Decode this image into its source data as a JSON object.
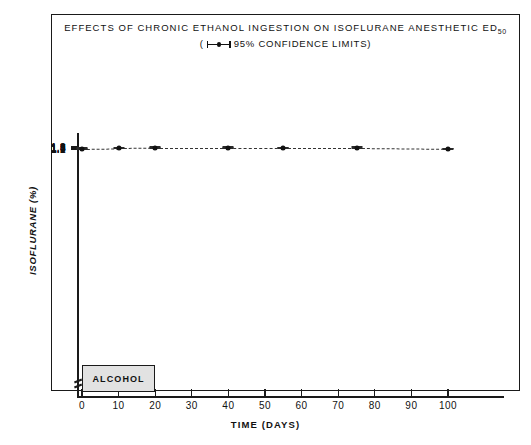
{
  "figure": {
    "title_main": "EFFECTS OF CHRONIC ETHANOL INGESTION ON ISOFLURANE ANESTHETIC ED",
    "title_main_sub": "50",
    "subtitle_prefix": "(",
    "subtitle_text": "95% CONFIDENCE LIMITS)",
    "annotation_box_label": "ALCOHOL",
    "colors": {
      "ink": "#1a1a1a",
      "data": "#2a2a2a",
      "alcohol_fill": "#e2e2e2",
      "background": "#ffffff"
    }
  },
  "chart_data": {
    "type": "line",
    "title": "EFFECTS OF CHRONIC ETHANOL INGESTION ON ISOFLURANE ANESTHETIC ED50",
    "subtitle": "(├──┤ 95% CONFIDENCE LIMITS)",
    "xlabel": "TIME (DAYS)",
    "ylabel": "ISOFLURANE (%)",
    "xlim": [
      -4,
      112
    ],
    "ylim": [
      1.05,
      1.95
    ],
    "grid": false,
    "legend": "none",
    "xticks": [
      0,
      10,
      20,
      30,
      40,
      50,
      60,
      70,
      80,
      90,
      100
    ],
    "xticklabels": [
      "0",
      "10",
      "20",
      "30",
      "40",
      "50",
      "60",
      "70",
      "80",
      "90",
      "100"
    ],
    "yticks": [
      1.1,
      1.2,
      1.3,
      1.4,
      1.5,
      1.6,
      1.7,
      1.8,
      1.9
    ],
    "yticklabels": [
      "1.1",
      "1.2",
      "1.3",
      "1.4",
      "1.5",
      "1.6",
      "1.7",
      "1.8",
      "1.9"
    ],
    "y_axis_break": true,
    "linestyle": "dashed",
    "marker": "filled-circle",
    "errorbar_label": "95% confidence limits",
    "x": [
      0,
      10,
      20,
      40,
      55,
      75,
      100
    ],
    "values": [
      1.33,
      1.54,
      1.7,
      1.7,
      1.68,
      1.65,
      1.33
    ],
    "error_low": [
      1.21,
      1.37,
      1.57,
      1.56,
      1.59,
      1.42,
      1.18
    ],
    "error_high": [
      1.45,
      1.74,
      1.86,
      1.84,
      1.78,
      1.87,
      1.43
    ],
    "annotations": [
      {
        "label": "ALCOHOL",
        "type": "box",
        "x_start": 0,
        "x_end": 20,
        "y_position": "below-axis"
      }
    ]
  }
}
